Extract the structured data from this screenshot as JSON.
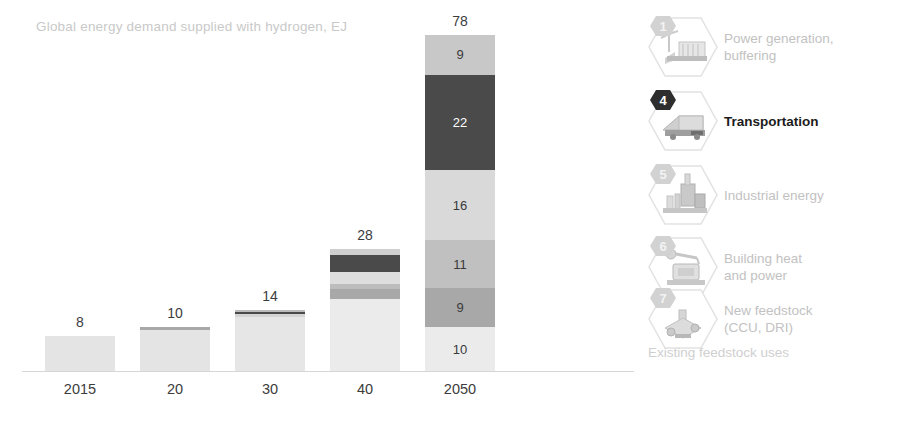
{
  "chart_data": {
    "type": "bar",
    "title": "Global energy demand supplied with hydrogen, EJ",
    "xlabel": "",
    "ylabel": "EJ",
    "ylim": [
      0,
      78
    ],
    "grid": false,
    "stacked": true,
    "legend_position": "right",
    "categories": [
      "2015",
      "20",
      "30",
      "40",
      "2050"
    ],
    "totals": [
      8,
      10,
      14,
      28,
      78
    ],
    "series": [
      {
        "name": "Power generation, buffering",
        "color": "#c8c8c8",
        "values": [
          0,
          0,
          0,
          1,
          9
        ]
      },
      {
        "name": "Transportation",
        "color": "#4a4a4a",
        "values": [
          0,
          0,
          0.4,
          4,
          22
        ]
      },
      {
        "name": "Industrial energy",
        "color": "#d9d9d9",
        "values": [
          0,
          0,
          0.5,
          3,
          16
        ]
      },
      {
        "name": "Building heat and power",
        "color": "#c0c0c0",
        "values": [
          0,
          0,
          0.6,
          1.2,
          11
        ]
      },
      {
        "name": "New feedstock (CCU, DRI)",
        "color": "#a8a8a8",
        "values": [
          0,
          0.5,
          1,
          2.2,
          9
        ]
      },
      {
        "name": "Existing feedstock uses",
        "color": "#e9e9e9",
        "values": [
          8,
          9.5,
          11.5,
          16.6,
          10
        ]
      }
    ],
    "bars": [
      {
        "category": "2015",
        "total_label": "8",
        "segments": [
          {
            "label": "",
            "value": 8,
            "color": "#e4e4e4"
          }
        ]
      },
      {
        "category": "20",
        "total_label": "10",
        "segments": [
          {
            "label": "",
            "value": 0.5,
            "color": "#a8a8a8"
          },
          {
            "label": "",
            "value": 9.5,
            "color": "#e4e4e4"
          }
        ]
      },
      {
        "category": "30",
        "total_label": "14",
        "segments": [
          {
            "label": "",
            "value": 0.5,
            "color": "#bcbcbc"
          },
          {
            "label": "",
            "value": 0.5,
            "color": "#4a4a4a"
          },
          {
            "label": "",
            "value": 0.6,
            "color": "#d4d4d4"
          },
          {
            "label": "",
            "value": 12.4,
            "color": "#e6e6e6"
          }
        ]
      },
      {
        "category": "40",
        "total_label": "28",
        "segments": [
          {
            "label": "",
            "value": 1.4,
            "color": "#cfcfcf"
          },
          {
            "label": "",
            "value": 4.0,
            "color": "#4a4a4a"
          },
          {
            "label": "",
            "value": 2.6,
            "color": "#dedede"
          },
          {
            "label": "",
            "value": 1.2,
            "color": "#bdbdbd"
          },
          {
            "label": "",
            "value": 2.2,
            "color": "#a8a8a8"
          },
          {
            "label": "",
            "value": 16.6,
            "color": "#ebebeb"
          }
        ]
      },
      {
        "category": "2050",
        "total_label": "78",
        "segments": [
          {
            "label": "9",
            "value": 9,
            "color": "#c8c8c8"
          },
          {
            "label": "22",
            "value": 22,
            "color": "#4a4a4a"
          },
          {
            "label": "16",
            "value": 16,
            "color": "#d9d9d9"
          },
          {
            "label": "11",
            "value": 11,
            "color": "#c0c0c0"
          },
          {
            "label": "9",
            "value": 9,
            "color": "#a8a8a8"
          },
          {
            "label": "10",
            "value": 10,
            "color": "#ebebeb"
          }
        ]
      }
    ]
  },
  "legend": {
    "items": [
      {
        "badge": "1",
        "label": "Power generation,\nbuffering",
        "icon": "power-plant-icon",
        "active": false
      },
      {
        "badge": "4",
        "label": "Transportation",
        "icon": "truck-icon",
        "active": true
      },
      {
        "badge": "5",
        "label": "Industrial energy",
        "icon": "factory-icon",
        "active": false
      },
      {
        "badge": "6",
        "label": "Building heat\nand power",
        "icon": "building-icon",
        "active": false
      },
      {
        "badge": "7",
        "label": "New feedstock\n(CCU, DRI)",
        "icon": "feedstock-icon",
        "active": false
      }
    ],
    "footnote": "Existing feedstock uses"
  },
  "colors": {
    "title_gray": "#c9c9c9",
    "label_dark": "#3c3c3c",
    "legend_gray": "#c2c2c2",
    "legend_active": "#1c1c1c",
    "axis": "#d6d6d6",
    "transport_dark": "#4a4a4a"
  }
}
